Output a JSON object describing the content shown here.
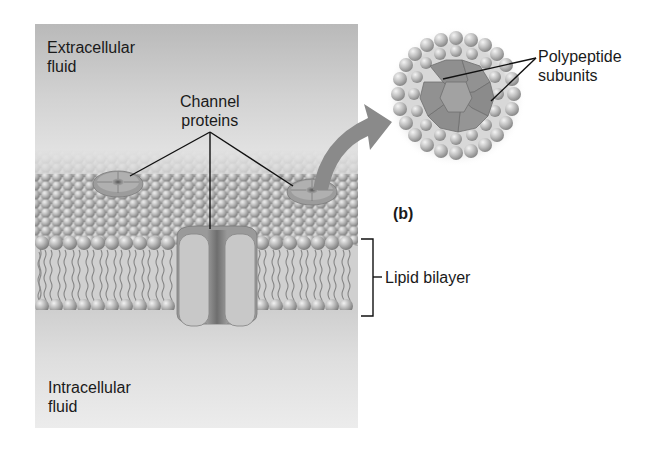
{
  "labels": {
    "extracellular": [
      "Extracellular",
      "fluid"
    ],
    "intracellular": [
      "Intracellular",
      "fluid"
    ],
    "channel_proteins": [
      "Channel",
      "proteins"
    ],
    "polypeptide_subunits": [
      "Polypeptide",
      "subunits"
    ],
    "lipid_bilayer": "Lipid bilayer",
    "panel_letter": "(b)"
  },
  "colors": {
    "panel_top": "#b9b9b9",
    "panel_mid": "#e2e2e2",
    "lipid_head": "#a8a8a8",
    "protein": "#8e8e8e",
    "protein_light": "#c4c4c4",
    "arrow": "#8a8a8a",
    "text": "#1a1a1a"
  }
}
